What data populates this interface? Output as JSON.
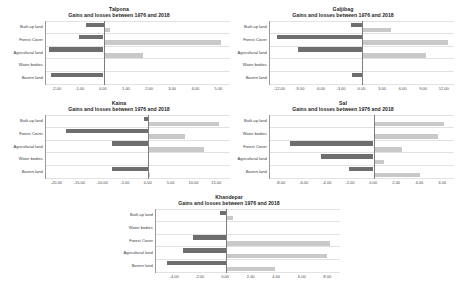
{
  "figure": {
    "background": "#ffffff",
    "loss_color": "#6e6e6e",
    "gain_color": "#c9c9c9"
  },
  "chart_data": [
    {
      "id": "talpona",
      "type": "bar",
      "orientation": "horizontal",
      "title": "Talpona",
      "subtitle": "Gains and losses between 1976 and 2018",
      "xlabel": "",
      "ylabel": "",
      "grid": true,
      "legend": "none",
      "categories": [
        "Built-up land",
        "Forest Cover",
        "Agricultural land",
        "Water bodies",
        "Barren land"
      ],
      "xlim": [
        -2.5,
        5.5
      ],
      "xticks": [
        "-2.00",
        "-1.00",
        "0.00",
        "1.00",
        "2.00",
        "3.00",
        "4.00",
        "5.00"
      ],
      "xtick_values": [
        -2,
        -1,
        0,
        1,
        2,
        3,
        4,
        5
      ],
      "series": [
        {
          "name": "Loss",
          "values": [
            -0.75,
            -1.05,
            -2.35,
            0.0,
            -2.3
          ]
        },
        {
          "name": "Gain",
          "values": [
            0.28,
            5.1,
            1.7,
            0.0,
            0.0
          ]
        }
      ]
    },
    {
      "id": "galjibag",
      "type": "bar",
      "orientation": "horizontal",
      "title": "Galjibag",
      "subtitle": "Gains and losses between 1976 and 2018",
      "xlabel": "",
      "ylabel": "",
      "grid": true,
      "legend": "none",
      "categories": [
        "Built-up land",
        "Forest Cover",
        "Agricultural land",
        "Water bodies",
        "Barren land"
      ],
      "xlim": [
        -13.5,
        13.5
      ],
      "xticks": [
        "-12.00",
        "-9.00",
        "-6.00",
        "-3.00",
        "0.00",
        "3.00",
        "6.00",
        "9.00",
        "12.00"
      ],
      "xtick_values": [
        -12,
        -9,
        -6,
        -3,
        0,
        3,
        6,
        9,
        12
      ],
      "series": [
        {
          "name": "Loss",
          "values": [
            -1.6,
            -12.4,
            -9.4,
            0.0,
            -1.5
          ]
        },
        {
          "name": "Gain",
          "values": [
            4.2,
            12.6,
            9.4,
            0.0,
            0.0
          ]
        }
      ]
    },
    {
      "id": "kaina",
      "type": "bar",
      "orientation": "horizontal",
      "title": "Kaina",
      "subtitle": "Gains and losses between 1976 and 2018",
      "xlabel": "",
      "ylabel": "",
      "grid": true,
      "legend": "none",
      "categories": [
        "Built-up land",
        "Forest Cover",
        "Agricultural land",
        "Water bodies",
        "Barren land"
      ],
      "xlim": [
        -22.5,
        18.0
      ],
      "xticks": [
        "-20.00",
        "-15.00",
        "-10.00",
        "-5.00",
        "0.00",
        "5.00",
        "10.00",
        "15.00"
      ],
      "xtick_values": [
        -20,
        -15,
        -10,
        -5,
        0,
        5,
        10,
        15
      ],
      "series": [
        {
          "name": "Loss",
          "values": [
            -0.9,
            -18.0,
            -8.0,
            0.0,
            -8.0
          ]
        },
        {
          "name": "Gain",
          "values": [
            15.6,
            8.0,
            12.3,
            0.0,
            0.4
          ]
        }
      ]
    },
    {
      "id": "sal",
      "type": "bar",
      "orientation": "horizontal",
      "title": "Sal",
      "subtitle": "Gains and losses between 1976 and 2018",
      "xlabel": "",
      "ylabel": "",
      "grid": true,
      "legend": "none",
      "categories": [
        "Built-up land",
        "Water bodies",
        "Forest Cover",
        "Agricultural land",
        "Barren land"
      ],
      "xlim": [
        -9.0,
        7.0
      ],
      "xticks": [
        "-8.00",
        "-6.00",
        "-4.00",
        "-2.00",
        "0.00",
        "2.00",
        "4.00",
        "6.00"
      ],
      "xtick_values": [
        -8,
        -6,
        -4,
        -2,
        0,
        2,
        4,
        6
      ],
      "series": [
        {
          "name": "Loss",
          "values": [
            0.0,
            0.0,
            -7.3,
            -4.6,
            -2.1
          ]
        },
        {
          "name": "Gain",
          "values": [
            6.1,
            5.6,
            2.5,
            0.9,
            4.0
          ]
        }
      ]
    },
    {
      "id": "khandepar",
      "type": "bar",
      "orientation": "horizontal",
      "title": "Khandepar",
      "subtitle": "Gains and losses between 1976 and 2018",
      "xlabel": "",
      "ylabel": "",
      "grid": true,
      "legend": "none",
      "categories": [
        "Built-up land",
        "Water bodies",
        "Forest Cover",
        "Agricultural land",
        "Barren land"
      ],
      "xlim": [
        -5.5,
        9.0
      ],
      "xticks": [
        "-4.00",
        "-2.00",
        "0.00",
        "2.00",
        "4.00",
        "6.00",
        "8.00"
      ],
      "xtick_values": [
        -4,
        -2,
        0,
        2,
        4,
        6,
        8
      ],
      "series": [
        {
          "name": "Loss",
          "values": [
            -0.45,
            0.0,
            -2.55,
            -3.4,
            -4.6
          ]
        },
        {
          "name": "Gain",
          "values": [
            0.55,
            0.0,
            8.2,
            8.0,
            3.85
          ]
        }
      ]
    }
  ]
}
